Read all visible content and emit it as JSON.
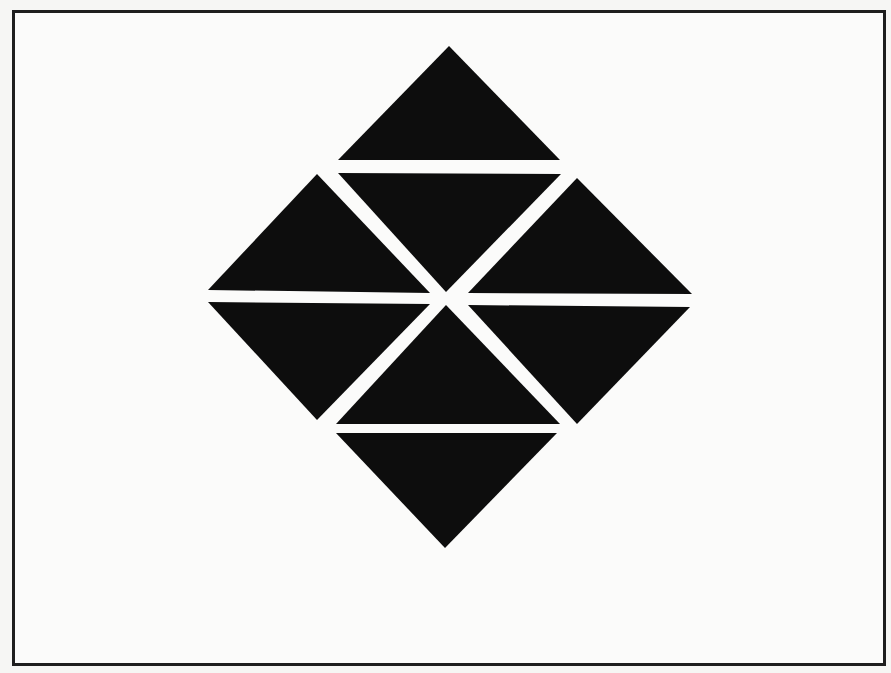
{
  "figure": {
    "frame": {
      "border_color": "#1e1e1e",
      "background": "#fbfbfa"
    },
    "fill_color": "#0d0d0d",
    "triangle_count": 8,
    "triangles": [
      {
        "name": "top",
        "points": "449,46 560,160 338,160"
      },
      {
        "name": "upper-center",
        "points": "338,173 561,174 446,292"
      },
      {
        "name": "upper-left",
        "points": "317,174 430,293 208,290"
      },
      {
        "name": "upper-right",
        "points": "577,178 692,294 468,293"
      },
      {
        "name": "lower-left",
        "points": "208,302 430,304 317,420"
      },
      {
        "name": "lower-right",
        "points": "468,305 690,307 577,424"
      },
      {
        "name": "lower-center",
        "points": "446,305 560,424 336,424"
      },
      {
        "name": "bottom",
        "points": "336,433 557,433 445,548"
      }
    ]
  }
}
